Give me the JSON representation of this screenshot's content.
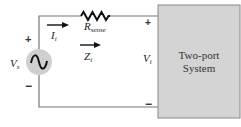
{
  "diagram": {
    "type": "circuit",
    "source": {
      "label_main": "V",
      "label_sub": "s",
      "symbol": "ac-sine",
      "plus": "+",
      "minus": "−",
      "fill_color": "#cfcfcf"
    },
    "resistor": {
      "label_main": "R",
      "label_sub": "sense"
    },
    "current": {
      "label_main": "I",
      "label_sub": "i",
      "direction": "right"
    },
    "impedance": {
      "label_main": "Z",
      "label_sub": "i",
      "direction": "right"
    },
    "input_voltage": {
      "label_main": "V",
      "label_sub": "i",
      "plus": "+",
      "minus": "−"
    },
    "system_box": {
      "line1": "Two-port",
      "line2": "System",
      "fill_color": "#d4d4d4"
    },
    "wire_color": "#777777"
  }
}
